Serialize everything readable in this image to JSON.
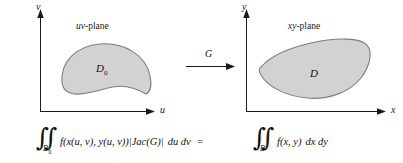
{
  "figure": {
    "type": "change-of-variables-diagram",
    "background": "#ffffff",
    "ink_color": "#1a1a1a",
    "region_fill": "#d2d2d2",
    "region_stroke": "#7d7d7d"
  },
  "panels": [
    {
      "id": "uv",
      "plane_label_italic": "uv",
      "plane_label_rest": "-plane",
      "x_axis_label": "u",
      "y_axis_label": "v",
      "region_label": "D",
      "region_subscript": "0"
    },
    {
      "id": "xy",
      "plane_label_italic": "xy",
      "plane_label_rest": "-plane",
      "x_axis_label": "x",
      "y_axis_label": "y",
      "region_label": "D",
      "region_subscript": ""
    }
  ],
  "map_arrow": {
    "label": "G",
    "direction": "right"
  },
  "equation": {
    "left": {
      "integral_symbol": "∬",
      "domain": "D",
      "domain_subscript": "0",
      "integrand": "f(x(u, v), y(u, v))|Jac(G)|",
      "differential": "du dv"
    },
    "relation": "=",
    "right": {
      "integral_symbol": "∬",
      "domain": "D",
      "domain_subscript": "",
      "integrand": "f(x, y)",
      "differential": "dx dy"
    }
  }
}
